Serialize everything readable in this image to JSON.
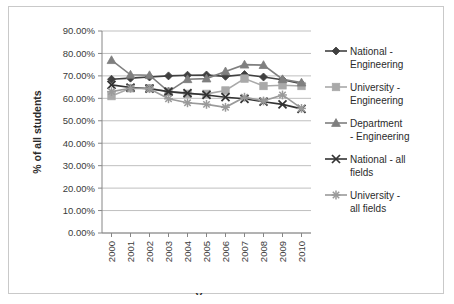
{
  "chart_data": {
    "type": "line",
    "title": "",
    "xlabel": "Year",
    "ylabel": "% of all students",
    "categories": [
      "2000",
      "2001",
      "2002",
      "2003",
      "2004",
      "2005",
      "2006",
      "2007",
      "2008",
      "2009",
      "2010"
    ],
    "x": [
      2000,
      2001,
      2002,
      2003,
      2004,
      2005,
      2006,
      2007,
      2008,
      2009,
      2010
    ],
    "ylim": [
      0,
      90
    ],
    "ytick_labels": [
      "0.00%",
      "10.00%",
      "20.00%",
      "30.00%",
      "40.00%",
      "50.00%",
      "60.00%",
      "70.00%",
      "80.00%",
      "90.00%"
    ],
    "ytick_values": [
      0,
      10,
      20,
      30,
      40,
      50,
      60,
      70,
      80,
      90
    ],
    "grid": true,
    "legend_position": "right",
    "series": [
      {
        "name": "National - Engineering",
        "marker": "diamond",
        "color": "#404040",
        "values": [
          68.5,
          69.0,
          69.5,
          70.0,
          70.3,
          70.4,
          69.8,
          70.6,
          69.5,
          68.3,
          66.5
        ]
      },
      {
        "name": "University - Engineering",
        "marker": "square",
        "color": "#a9a9a9",
        "values": [
          61.0,
          64.5,
          64.5,
          63.0,
          62.0,
          62.0,
          63.5,
          68.8,
          65.5,
          65.8,
          65.5
        ]
      },
      {
        "name": "Department - Engineering",
        "marker": "triangle",
        "color": "#7f7f7f",
        "values": [
          77.0,
          70.5,
          70.3,
          63.0,
          68.5,
          68.8,
          72.0,
          75.0,
          74.8,
          68.5,
          67.0
        ]
      },
      {
        "name": "National - all fields",
        "marker": "x",
        "color": "#333333",
        "values": [
          66.0,
          64.8,
          64.3,
          63.0,
          62.3,
          61.5,
          60.5,
          59.8,
          58.5,
          57.3,
          55.3
        ]
      },
      {
        "name": "University - all fields",
        "marker": "asterisk",
        "color": "#9a9a9a",
        "values": [
          63.0,
          64.5,
          64.3,
          59.8,
          58.0,
          57.3,
          56.0,
          60.5,
          58.8,
          61.5,
          55.5
        ]
      }
    ]
  },
  "legend": {
    "entries": [
      {
        "line1": "National -",
        "line2": "Engineering"
      },
      {
        "line1": "University -",
        "line2": "Engineering"
      },
      {
        "line1": "Department",
        "line2": "- Engineering"
      },
      {
        "line1": "National - all",
        "line2": "fields"
      },
      {
        "line1": "University -",
        "line2": "all fields"
      }
    ]
  }
}
